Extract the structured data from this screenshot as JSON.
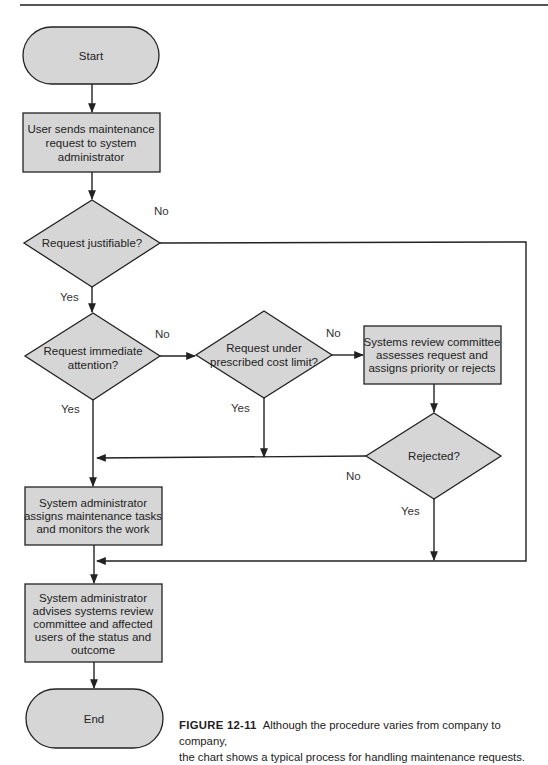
{
  "figure": {
    "number": "FIGURE 12-11",
    "caption_line1": "Although the procedure varies from company to company,",
    "caption_line2": "the chart shows a typical process for handling maintenance requests."
  },
  "colors": {
    "shape_fill": "#d6d6d6",
    "stroke": "#222222"
  },
  "nodes": {
    "start": {
      "type": "terminal",
      "lines": [
        "Start"
      ]
    },
    "user_sends": {
      "type": "process",
      "lines": [
        "User sends maintenance",
        "request to system",
        "administrator"
      ]
    },
    "justifiable": {
      "type": "decision",
      "lines": [
        "Request justifiable?"
      ]
    },
    "immediate": {
      "type": "decision",
      "lines": [
        "Request immediate",
        "attention?"
      ]
    },
    "cost_limit": {
      "type": "decision",
      "lines": [
        "Request under",
        "prescribed cost limit?"
      ]
    },
    "committee": {
      "type": "process",
      "lines": [
        "Systems review committee",
        "assesses request and",
        "assigns priority or rejects"
      ]
    },
    "rejected": {
      "type": "decision",
      "lines": [
        "Rejected?"
      ]
    },
    "assigns": {
      "type": "process",
      "lines": [
        "System administrator",
        "assigns maintenance tasks",
        "and monitors the work"
      ]
    },
    "advises": {
      "type": "process",
      "lines": [
        "System administrator",
        "advises systems review",
        "committee and affected",
        "users of the status and",
        "outcome"
      ]
    },
    "end": {
      "type": "terminal",
      "lines": [
        "End"
      ]
    }
  },
  "edge_labels": {
    "justifiable_no": "No",
    "justifiable_yes": "Yes",
    "immediate_no": "No",
    "immediate_yes": "Yes",
    "cost_no": "No",
    "cost_yes": "Yes",
    "rejected_no": "No",
    "rejected_yes": "Yes"
  }
}
